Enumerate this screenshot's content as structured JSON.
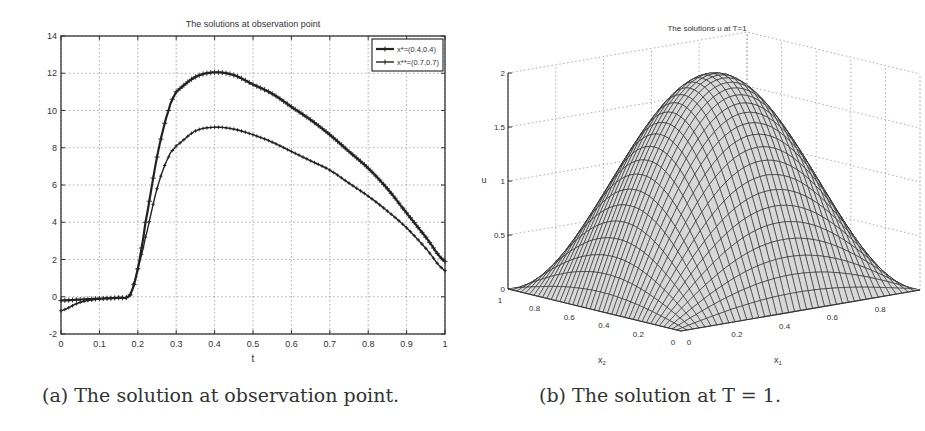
{
  "figure": {
    "caption_a": "(a) The solution at observation point.",
    "caption_b": "(b) The solution at T = 1."
  },
  "chart_data": [
    {
      "type": "line",
      "title": "The solutions at observation point",
      "xlabel": "t",
      "ylabel": "",
      "xlim": [
        0,
        1
      ],
      "ylim": [
        -2,
        14
      ],
      "xticks": [
        "0",
        "0.1",
        "0.2",
        "0.3",
        "0.4",
        "0.5",
        "0.6",
        "0.7",
        "0.8",
        "0.9",
        "1"
      ],
      "yticks": [
        "-2",
        "0",
        "2",
        "4",
        "6",
        "8",
        "10",
        "12",
        "14"
      ],
      "grid": true,
      "legend_position": "upper right",
      "x": [
        0,
        0.05,
        0.1,
        0.15,
        0.18,
        0.2,
        0.22,
        0.25,
        0.28,
        0.3,
        0.35,
        0.4,
        0.45,
        0.5,
        0.55,
        0.6,
        0.65,
        0.7,
        0.75,
        0.8,
        0.85,
        0.9,
        0.95,
        1.0
      ],
      "series": [
        {
          "name": "x*=(0.4,0.4)",
          "marker": "+",
          "values": [
            -0.2,
            -0.15,
            -0.1,
            -0.05,
            0.1,
            1.5,
            4.0,
            7.5,
            10.0,
            11.0,
            11.8,
            12.05,
            11.9,
            11.4,
            10.9,
            10.2,
            9.5,
            8.7,
            7.8,
            6.9,
            5.8,
            4.5,
            3.2,
            1.9
          ]
        },
        {
          "name": "x**=(0.7,0.7)",
          "marker": "+",
          "values": [
            -0.75,
            -0.3,
            -0.12,
            -0.05,
            0.1,
            1.5,
            3.2,
            5.8,
            7.5,
            8.1,
            8.9,
            9.1,
            9.0,
            8.7,
            8.3,
            7.8,
            7.3,
            6.8,
            6.1,
            5.4,
            4.6,
            3.7,
            2.6,
            1.4
          ]
        }
      ]
    },
    {
      "type": "surface",
      "title": "The solutions u at T=1",
      "xlabel": "x1",
      "ylabel": "x2",
      "zlabel": "u",
      "xlim": [
        0,
        1
      ],
      "ylim": [
        0,
        1
      ],
      "zlim": [
        0,
        2
      ],
      "xticks": [
        "0",
        "0.2",
        "0.4",
        "0.6",
        "0.8",
        "1"
      ],
      "yticks": [
        "0",
        "0.2",
        "0.4",
        "0.6",
        "0.8",
        "1"
      ],
      "zticks": [
        "0",
        "0.5",
        "1",
        "1.5",
        "2"
      ],
      "grid": true,
      "function": "u = 2*sin(pi*x1)*sin(pi*x2)",
      "peak": {
        "x1": 0.5,
        "x2": 0.5,
        "u": 2.0
      }
    }
  ]
}
